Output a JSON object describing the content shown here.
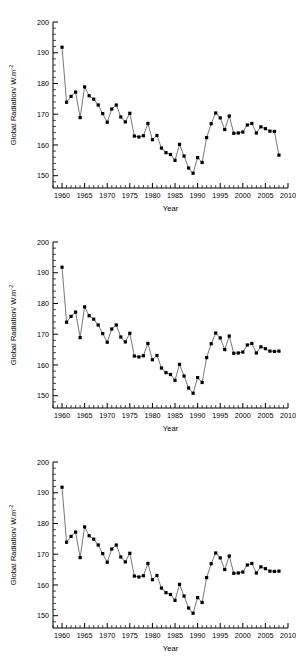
{
  "figure": {
    "panel_count": 3,
    "background": "#ffffff",
    "marker_color": "#000000",
    "line_color": "#555555"
  },
  "axes": {
    "y_label_prefix": "Global Radiation/ W.m",
    "y_label_exponent": "-2",
    "x_label": "Year",
    "x_ticks": [
      "1960",
      "1965",
      "1970",
      "1975",
      "1980",
      "1985",
      "1990",
      "1995",
      "2000",
      "2005",
      "2010"
    ],
    "y_ticks": [
      "150",
      "160",
      "170",
      "180",
      "190",
      "200"
    ],
    "xlim": [
      1958,
      2010
    ],
    "ylim": [
      146,
      200
    ],
    "x_major_step": 5,
    "x_minor_step": 1,
    "y_major_step": 10,
    "y_minor_step": 2,
    "grid": "off",
    "legend": "none"
  },
  "chart_data": [
    {
      "type": "line",
      "title": "",
      "xlabel": "Year",
      "ylabel": "Global Radiation/ W.m-2",
      "xlim": [
        1958,
        2010
      ],
      "ylim": [
        146,
        200
      ],
      "grid": false,
      "legend": "none",
      "marker": "square",
      "x": [
        1960,
        1961,
        1962,
        1963,
        1964,
        1965,
        1966,
        1967,
        1968,
        1969,
        1970,
        1971,
        1972,
        1973,
        1974,
        1975,
        1976,
        1977,
        1978,
        1979,
        1980,
        1981,
        1982,
        1983,
        1984,
        1985,
        1986,
        1987,
        1988,
        1989,
        1990,
        1991,
        1992,
        1993,
        1994,
        1995,
        1996,
        1997,
        1998,
        1999,
        2000,
        2001,
        2002,
        2003,
        2004,
        2005,
        2006,
        2007,
        2008
      ],
      "y": [
        191.8,
        173.9,
        175.8,
        177.2,
        168.9,
        178.9,
        176.0,
        174.9,
        173.0,
        170.2,
        167.4,
        171.7,
        173.0,
        169.1,
        167.5,
        170.3,
        162.9,
        162.6,
        163.0,
        167.0,
        161.7,
        163.1,
        159.0,
        157.5,
        156.9,
        155.0,
        160.2,
        156.4,
        152.5,
        150.8,
        155.9,
        154.3,
        162.4,
        166.9,
        170.4,
        168.8,
        165.0,
        169.4,
        163.8,
        163.9,
        164.2,
        166.5,
        167.0,
        163.9,
        165.9,
        165.3,
        164.5,
        164.4,
        156.7
      ]
    },
    {
      "type": "line",
      "title": "",
      "xlabel": "Year",
      "ylabel": "Global Radiation/ W.m-2",
      "xlim": [
        1958,
        2010
      ],
      "ylim": [
        146,
        200
      ],
      "grid": false,
      "legend": "none",
      "marker": "square",
      "x": [
        1960,
        1961,
        1962,
        1963,
        1964,
        1965,
        1966,
        1967,
        1968,
        1969,
        1970,
        1971,
        1972,
        1973,
        1974,
        1975,
        1976,
        1977,
        1978,
        1979,
        1980,
        1981,
        1982,
        1983,
        1984,
        1985,
        1986,
        1987,
        1988,
        1989,
        1990,
        1991,
        1992,
        1993,
        1994,
        1995,
        1996,
        1997,
        1998,
        1999,
        2000,
        2001,
        2002,
        2003,
        2004,
        2005,
        2006,
        2007,
        2008
      ],
      "y": [
        191.8,
        173.9,
        175.8,
        177.2,
        168.9,
        178.9,
        176.0,
        174.9,
        173.0,
        170.2,
        167.4,
        171.7,
        173.0,
        169.1,
        167.5,
        170.3,
        162.9,
        162.6,
        163.0,
        167.0,
        161.7,
        163.1,
        159.0,
        157.5,
        156.9,
        155.0,
        160.2,
        156.4,
        152.5,
        150.8,
        155.9,
        154.3,
        162.4,
        166.9,
        170.4,
        168.8,
        165.0,
        169.4,
        163.8,
        163.9,
        164.2,
        166.5,
        167.0,
        163.9,
        165.9,
        165.3,
        164.5,
        164.4,
        164.5
      ]
    },
    {
      "type": "line",
      "title": "",
      "xlabel": "Year",
      "ylabel": "Global Radiation/ W.m-2",
      "xlim": [
        1958,
        2010
      ],
      "ylim": [
        146,
        200
      ],
      "grid": false,
      "legend": "none",
      "marker": "square",
      "x": [
        1960,
        1961,
        1962,
        1963,
        1964,
        1965,
        1966,
        1967,
        1968,
        1969,
        1970,
        1971,
        1972,
        1973,
        1974,
        1975,
        1976,
        1977,
        1978,
        1979,
        1980,
        1981,
        1982,
        1983,
        1984,
        1985,
        1986,
        1987,
        1988,
        1989,
        1990,
        1991,
        1992,
        1993,
        1994,
        1995,
        1996,
        1997,
        1998,
        1999,
        2000,
        2001,
        2002,
        2003,
        2004,
        2005,
        2006,
        2007,
        2008
      ],
      "y": [
        191.8,
        173.9,
        175.8,
        177.2,
        168.9,
        178.9,
        176.0,
        174.9,
        173.0,
        170.2,
        167.4,
        171.7,
        173.0,
        169.1,
        167.5,
        170.3,
        162.9,
        162.6,
        163.0,
        167.0,
        161.7,
        163.1,
        159.0,
        157.5,
        156.9,
        155.0,
        160.2,
        156.4,
        152.5,
        150.8,
        155.9,
        154.3,
        162.4,
        166.9,
        170.4,
        168.8,
        165.0,
        169.4,
        163.8,
        163.9,
        164.2,
        166.5,
        167.0,
        163.9,
        165.9,
        165.3,
        164.5,
        164.4,
        164.5
      ]
    }
  ]
}
